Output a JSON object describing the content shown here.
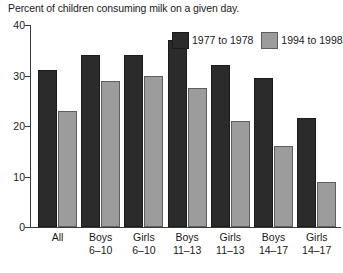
{
  "chart_data": {
    "type": "bar",
    "title": "Percent of children consuming milk on a given day.",
    "xlabel": "",
    "ylabel": "",
    "ylim": [
      0,
      40
    ],
    "yticks": [
      0,
      10,
      20,
      30,
      40
    ],
    "ytick_labels": [
      "0",
      "10",
      "20",
      "30",
      "40"
    ],
    "grid": false,
    "legend_position": "top-right",
    "categories": [
      "All",
      "Boys 6–10",
      "Girls 6–10",
      "Boys 11–13",
      "Girls 11–13",
      "Boys 14–17",
      "Girls 14–17"
    ],
    "category_lines": [
      {
        "line1": "All",
        "line2": ""
      },
      {
        "line1": "Boys",
        "line2": "6–10"
      },
      {
        "line1": "Girls",
        "line2": "6–10"
      },
      {
        "line1": "Boys",
        "line2": "11–13"
      },
      {
        "line1": "Girls",
        "line2": "11–13"
      },
      {
        "line1": "Boys",
        "line2": "14–17"
      },
      {
        "line1": "Girls",
        "line2": "14–17"
      }
    ],
    "series": [
      {
        "name": "1977 to 1978",
        "color": "#2b2b2b",
        "values": [
          31,
          34,
          34,
          37,
          32,
          29.5,
          21.5
        ]
      },
      {
        "name": "1994 to 1998",
        "color": "#9c9c9c",
        "values": [
          23,
          29,
          30,
          27.5,
          21,
          16,
          9
        ]
      }
    ]
  },
  "legend": {
    "items": [
      {
        "label": "1977 to 1978",
        "swatch": "dark"
      },
      {
        "label": "1994 to 1998",
        "swatch": "light"
      }
    ]
  }
}
